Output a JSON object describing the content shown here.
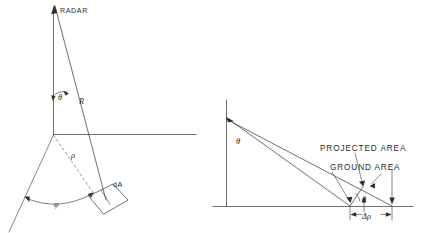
{
  "figure": {
    "background_color": "#ffffff",
    "line_color": "#4a4a4a",
    "text_color": "#2b2b2b"
  },
  "left_panel": {
    "name": "three-dimensional radar geometry",
    "labels": {
      "radar": "RADAR",
      "incidence_angle": "θ",
      "slant_range": "R",
      "ground_range": "ρ",
      "azimuth_angle": "φ",
      "area_element": "dA"
    }
  },
  "right_panel": {
    "name": "projected versus ground area cross section",
    "labels": {
      "incidence_angle": "θ",
      "projected_area": "PROJECTED  AREA",
      "ground_area": "GROUND  AREA",
      "grazing_angle": "θ",
      "range_increment": "Δρ"
    }
  }
}
